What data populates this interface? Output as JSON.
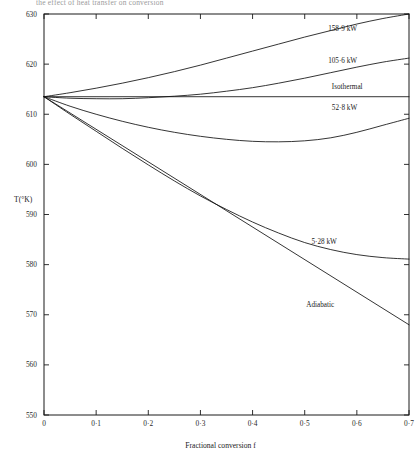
{
  "caption": {
    "text": "the effect of heat transfer on conversion"
  },
  "chart_data": {
    "type": "line",
    "title": "",
    "xlabel": "Fractional conversion f",
    "ylabel": "T(°K)",
    "xlim": [
      0,
      0.7
    ],
    "ylim": [
      550,
      630
    ],
    "grid": false,
    "legend": "inline-curve-labels",
    "xticks": [
      0,
      0.1,
      0.2,
      0.3,
      0.4,
      0.5,
      0.6,
      0.7
    ],
    "xticklabels": [
      "0",
      "0·1",
      "0·2",
      "0·3",
      "0·4",
      "0·5",
      "0·6",
      "0·7"
    ],
    "yticks": [
      550,
      560,
      570,
      580,
      590,
      600,
      610,
      620,
      630
    ],
    "yticklabels": [
      "550",
      "560",
      "570",
      "580",
      "590",
      "600",
      "610",
      "620",
      "630"
    ],
    "start_point": {
      "x": 0,
      "y": 613.5
    },
    "series": [
      {
        "name": "158·9 kW",
        "label": "158·9 kW",
        "label_x": 0.545,
        "label_y": 626.6,
        "x": [
          0,
          0.05,
          0.1,
          0.15,
          0.2,
          0.25,
          0.3,
          0.35,
          0.4,
          0.45,
          0.5,
          0.55,
          0.6,
          0.65,
          0.7
        ],
        "y": [
          613.5,
          614.3,
          615.2,
          616.2,
          617.3,
          618.5,
          619.8,
          621.2,
          622.6,
          624.0,
          625.4,
          626.7,
          628.0,
          629.1,
          630.0
        ]
      },
      {
        "name": "105·6 kW",
        "label": "105·6 kW",
        "label_x": 0.545,
        "label_y": 620.3,
        "x": [
          0,
          0.05,
          0.1,
          0.15,
          0.2,
          0.25,
          0.3,
          0.35,
          0.4,
          0.45,
          0.5,
          0.55,
          0.6,
          0.65,
          0.7
        ],
        "y": [
          613.5,
          613.2,
          613.1,
          613.1,
          613.3,
          613.6,
          614.0,
          614.6,
          615.3,
          616.2,
          617.2,
          618.3,
          619.4,
          620.4,
          621.2
        ]
      },
      {
        "name": "Isothermal",
        "label": "Isothermal",
        "label_x": 0.552,
        "label_y": 615.0,
        "x": [
          0,
          0.7
        ],
        "y": [
          613.5,
          613.5
        ]
      },
      {
        "name": "52·8 kW",
        "label": "52·8 kW",
        "label_x": 0.552,
        "label_y": 610.8,
        "x": [
          0,
          0.05,
          0.1,
          0.15,
          0.2,
          0.25,
          0.3,
          0.35,
          0.4,
          0.45,
          0.5,
          0.55,
          0.6,
          0.65,
          0.7
        ],
        "y": [
          613.5,
          611.6,
          610.0,
          608.6,
          607.4,
          606.4,
          605.6,
          605.0,
          604.6,
          604.5,
          604.7,
          605.3,
          606.4,
          607.8,
          609.2
        ]
      },
      {
        "name": "5·28 kW",
        "label": "5·28 kW",
        "label_x": 0.513,
        "label_y": 584.2,
        "x": [
          0,
          0.05,
          0.1,
          0.15,
          0.2,
          0.25,
          0.3,
          0.35,
          0.4,
          0.45,
          0.5,
          0.55,
          0.6,
          0.65,
          0.7
        ],
        "y": [
          613.5,
          610.0,
          606.6,
          603.2,
          599.9,
          596.7,
          593.7,
          591.0,
          588.5,
          586.3,
          584.4,
          583.0,
          582.0,
          581.4,
          581.1
        ]
      },
      {
        "name": "Adiabatic",
        "label": "Adiabatic",
        "label_x": 0.503,
        "label_y": 571.6,
        "x": [
          0,
          0.7
        ],
        "y": [
          613.5,
          568.0
        ]
      }
    ]
  }
}
